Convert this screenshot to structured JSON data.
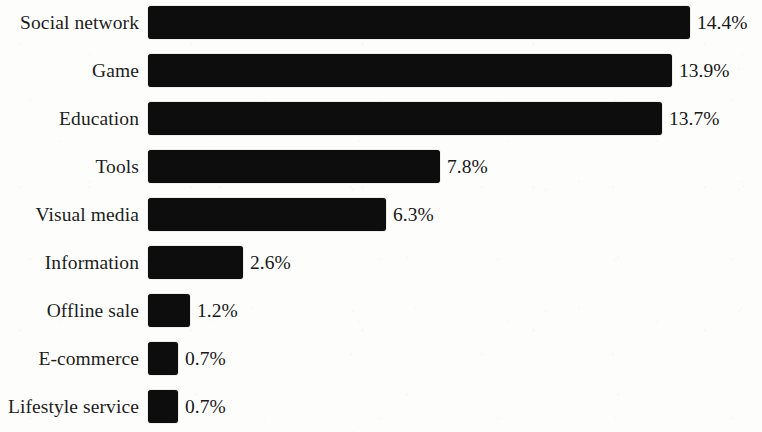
{
  "chart_data": {
    "type": "bar",
    "orientation": "horizontal",
    "title": "",
    "subtitle": "",
    "xlabel": "",
    "ylabel": "",
    "grid": false,
    "legend": null,
    "axis_visible": false,
    "value_suffix": "%",
    "xlim": [
      0,
      14.4
    ],
    "categories": [
      "Social network",
      "Game",
      "Education",
      "Tools",
      "Visual media",
      "Information",
      "Offline sale",
      "E-commerce",
      "Lifestyle service"
    ],
    "values": [
      14.4,
      13.9,
      13.7,
      7.8,
      6.3,
      2.6,
      1.2,
      0.7,
      0.7
    ],
    "value_labels": [
      "14.4%",
      "13.9%",
      "13.7%",
      "7.8%",
      "6.3%",
      "2.6%",
      "1.2%",
      "0.7%",
      "0.7%"
    ],
    "bar_pixel_widths": [
      542,
      524,
      514,
      292,
      238,
      95,
      42,
      30,
      30
    ],
    "bar_color": "#0d0d0d",
    "background_color": "#fdfdfc",
    "text_color": "#1a1a1a"
  },
  "layout": {
    "bar_start_x": 157,
    "row_pitch": 48,
    "first_row_top": 6,
    "bar_height": 33,
    "label_column_width": 148
  }
}
